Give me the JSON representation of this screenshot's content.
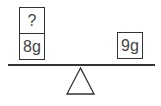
{
  "diagram": {
    "left_pan": {
      "boxes": [
        {
          "label": "?"
        },
        {
          "label": "8g"
        }
      ]
    },
    "right_pan": {
      "boxes": [
        {
          "label": "9g"
        }
      ]
    },
    "colors": {
      "stroke": "#333333",
      "text": "#444444",
      "background": "#ffffff"
    }
  }
}
